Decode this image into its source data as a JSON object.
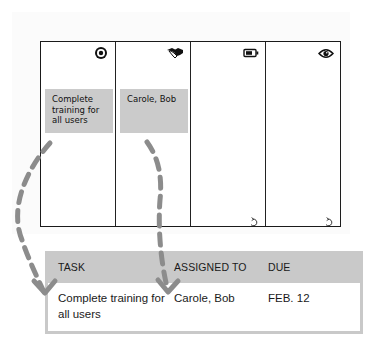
{
  "board": {
    "columns": [
      {
        "icon": "target-icon",
        "card": "Complete training for all users"
      },
      {
        "icon": "handshake-icon",
        "card": "Carole, Bob"
      },
      {
        "icon": "battery-icon",
        "card": null
      },
      {
        "icon": "eye-icon",
        "card": null
      }
    ],
    "undo_icon": "undo-arrow-icon"
  },
  "arrows": [
    {
      "from": "board.columns.0.card",
      "to": "table.rows.0.task",
      "style": "dashed",
      "color": "#8c8c8c"
    },
    {
      "from": "board.columns.1.card",
      "to": "table.rows.0.assigned_to",
      "style": "dashed",
      "color": "#8c8c8c"
    }
  ],
  "table": {
    "headers": {
      "task": "TASK",
      "assigned_to": "ASSIGNED TO",
      "due": "DUE"
    },
    "rows": [
      {
        "task": "Complete training for all users",
        "assigned_to": "Carole, Bob",
        "due": "FEB. 12"
      }
    ]
  },
  "colors": {
    "card_fill": "#cbcbcb",
    "table_header_fill": "#c9c9c9",
    "arrow": "#8c8c8c",
    "border": "#1a1a1a"
  }
}
